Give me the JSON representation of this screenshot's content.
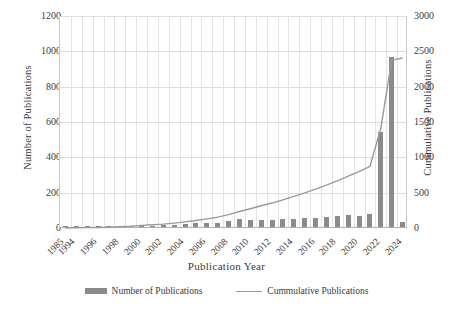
{
  "chart_data": {
    "type": "bar",
    "title": "",
    "xlabel": "Publication Year",
    "ylabel": "Number of Publications",
    "y2label": "Cummulative Publications",
    "ylim": [
      0,
      1200
    ],
    "y2lim": [
      0,
      3000
    ],
    "yticks": [
      0,
      200,
      400,
      600,
      800,
      1000,
      1200
    ],
    "y2ticks": [
      0,
      500,
      1000,
      1500,
      2000,
      2500,
      3000
    ],
    "grid": "horizontal-and-vertical",
    "legend_position": "bottom-center",
    "categories": [
      "1985",
      "1994",
      "1995",
      "1996",
      "1997",
      "1998",
      "1999",
      "2000",
      "2001",
      "2002",
      "2003",
      "2004",
      "2005",
      "2006",
      "2007",
      "2008",
      "2009",
      "2010",
      "2011",
      "2012",
      "2013",
      "2014",
      "2015",
      "2016",
      "2017",
      "2018",
      "2019",
      "2020",
      "2021",
      "2022",
      "2023",
      "2024"
    ],
    "tick_labels": [
      "1985",
      "1994",
      "",
      "1996",
      "",
      "1998",
      "",
      "2000",
      "",
      "2002",
      "",
      "2004",
      "",
      "2006",
      "",
      "2008",
      "",
      "2010",
      "",
      "2012",
      "",
      "2014",
      "",
      "2016",
      "",
      "2018",
      "",
      "2020",
      "",
      "2022",
      "",
      "2024"
    ],
    "series": [
      {
        "name": "Number of Publications",
        "type": "bar",
        "axis": "left",
        "color": "#8b8b8b",
        "values": [
          1,
          2,
          2,
          3,
          3,
          6,
          8,
          12,
          8,
          10,
          14,
          18,
          20,
          22,
          24,
          36,
          44,
          40,
          42,
          38,
          46,
          48,
          50,
          52,
          58,
          60,
          66,
          64,
          74,
          540,
          965,
          30
        ]
      },
      {
        "name": "Cummulative Publications",
        "type": "line",
        "axis": "right",
        "color": "#9a9a9a",
        "values": [
          1,
          3,
          5,
          8,
          11,
          17,
          25,
          37,
          45,
          55,
          69,
          87,
          107,
          129,
          153,
          189,
          233,
          273,
          315,
          353,
          399,
          447,
          497,
          549,
          607,
          667,
          733,
          797,
          871,
          1411,
          2376,
          2406
        ]
      }
    ],
    "legend": [
      {
        "label": "Number of Publications",
        "marker": "bar",
        "color": "#8b8b8b"
      },
      {
        "label": "Cummulative Publications",
        "marker": "line",
        "color": "#9a9a9a"
      }
    ]
  }
}
